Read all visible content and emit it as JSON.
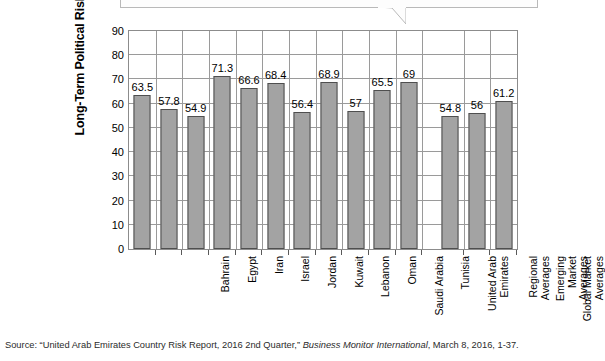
{
  "chart_data": {
    "type": "bar",
    "title": "",
    "xlabel": "",
    "ylabel": "Long-Term Political Risk",
    "ylim": [
      0,
      90
    ],
    "ytick_step": 10,
    "yticks": [
      "0",
      "10",
      "20",
      "30",
      "40",
      "50",
      "60",
      "70",
      "80",
      "90"
    ],
    "grid": true,
    "legend": "none",
    "bar_color": "#a3a3a3",
    "bar_border_color": "#4f4f4f",
    "categories": [
      "Bahrain",
      "Egypt",
      "Iran",
      "Israel",
      "Jordan",
      "Kuwait",
      "Lebanon",
      "Oman",
      "Saudi Arabia",
      "Tunisia",
      "United Arab\nEmirates",
      "Regional Averages",
      "Emerging Market\nAverages",
      "Global Market\nAverages"
    ],
    "values": [
      63.5,
      57.8,
      54.9,
      71.3,
      66.6,
      68.4,
      56.4,
      68.9,
      57,
      65.5,
      69,
      54.8,
      56,
      61.2
    ],
    "value_labels": [
      "63.5",
      "57.8",
      "54.9",
      "71.3",
      "66.6",
      "68.4",
      "56.4",
      "68.9",
      "57",
      "65.5",
      "69",
      "54.8",
      "56",
      "61.2"
    ]
  },
  "source": {
    "prefix": "Source: “United Arab Emirates Country Risk Report, 2016 2nd Quarter,” ",
    "publication": "Business Monitor International",
    "suffix": ", March 8, 2016, 1-37."
  },
  "callout": {
    "name": "callout-bubble",
    "text": ""
  }
}
